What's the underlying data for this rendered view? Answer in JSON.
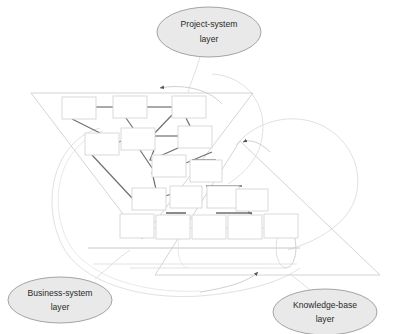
{
  "figure": {
    "kind": "layered-architecture-diagram",
    "background_color": "#ffffff",
    "callout_fill": "#e9e9e9",
    "callout_stroke": "#9a9a9a",
    "callout_text_color": "#2a2a2a",
    "shape_stroke": "#d2d2d2",
    "connector_color": "#6b6b6b",
    "outline_curve_color": "#d8d8d8",
    "arrow_color": "#555555"
  },
  "callouts": [
    {
      "id": "project-system",
      "line1": "Project-system",
      "line2": "layer",
      "cx": 209,
      "cy": 32,
      "rx": 52,
      "ry": 25
    },
    {
      "id": "business-system",
      "line1": "Business-system",
      "line2": "layer",
      "cx": 60,
      "cy": 300,
      "rx": 52,
      "ry": 23
    },
    {
      "id": "knowledge-base",
      "line1": "Knowledge-base",
      "line2": "layer",
      "cx": 325,
      "cy": 312,
      "rx": 52,
      "ry": 23
    }
  ],
  "layers": [
    {
      "id": "project-system-layer",
      "shape": "inverted-triangle",
      "label": "Project-system layer",
      "contents": "network of linked process boxes"
    },
    {
      "id": "business-system-layer",
      "shape": "oval-outline",
      "label": "Business-system layer",
      "contents": "enclosing boundary oval"
    },
    {
      "id": "knowledge-base-layer",
      "shape": "upright-triangle",
      "label": "Knowledge-base layer",
      "contents": "pyramid hierarchy of boxes and a database cylinder"
    }
  ],
  "network_boxes": [
    {
      "id": "n1",
      "x": 62,
      "y": 97,
      "w": 34,
      "h": 22
    },
    {
      "id": "n2",
      "x": 113,
      "y": 96,
      "w": 34,
      "h": 22
    },
    {
      "id": "n3",
      "x": 172,
      "y": 96,
      "w": 34,
      "h": 22
    },
    {
      "id": "n4",
      "x": 85,
      "y": 133,
      "w": 34,
      "h": 22
    },
    {
      "id": "n5",
      "x": 121,
      "y": 128,
      "w": 34,
      "h": 22
    },
    {
      "id": "n6",
      "x": 178,
      "y": 126,
      "w": 34,
      "h": 22
    },
    {
      "id": "n7",
      "x": 152,
      "y": 155,
      "w": 34,
      "h": 22
    },
    {
      "id": "n8",
      "x": 132,
      "y": 188,
      "w": 34,
      "h": 22
    }
  ],
  "network_links": [
    {
      "from": "n1",
      "to": "n2"
    },
    {
      "from": "n2",
      "to": "n3"
    },
    {
      "from": "n1",
      "to": "n4"
    },
    {
      "from": "n2",
      "to": "n5"
    },
    {
      "from": "n3",
      "to": "n5"
    },
    {
      "from": "n4",
      "to": "n5"
    },
    {
      "from": "n5",
      "to": "n6"
    },
    {
      "from": "n3",
      "to": "n6"
    },
    {
      "from": "n5",
      "to": "n7"
    },
    {
      "from": "n6",
      "to": "n7"
    },
    {
      "from": "n4",
      "to": "n8"
    },
    {
      "from": "n7",
      "to": "n8"
    }
  ],
  "pyramid": {
    "levels": [
      {
        "level": 1,
        "count": 1,
        "boxes": [
          {
            "x": 190,
            "y": 160,
            "w": 32,
            "h": 22
          }
        ]
      },
      {
        "level": 2,
        "count": 3,
        "boxes": [
          {
            "x": 170,
            "y": 186,
            "w": 32,
            "h": 22
          },
          {
            "x": 207,
            "y": 186,
            "w": 32,
            "h": 22
          },
          {
            "x": 236,
            "y": 189,
            "w": 32,
            "h": 22
          }
        ]
      },
      {
        "level": 3,
        "count": 5,
        "boxes": [
          {
            "x": 120,
            "y": 214,
            "w": 34,
            "h": 24
          },
          {
            "x": 156,
            "y": 215,
            "w": 34,
            "h": 24
          },
          {
            "x": 192,
            "y": 215,
            "w": 34,
            "h": 24
          },
          {
            "x": 228,
            "y": 215,
            "w": 34,
            "h": 24
          },
          {
            "x": 264,
            "y": 214,
            "w": 34,
            "h": 24
          }
        ]
      }
    ]
  },
  "database_cylinder": {
    "label": "knowledge-base store",
    "x": 118,
    "y": 240,
    "w": 180,
    "h": 22
  },
  "arrows": [
    {
      "id": "arrow-to-project-layer",
      "direction": "left",
      "x": 156,
      "y": 88
    },
    {
      "id": "arrow-to-knowledge-layer",
      "direction": "left",
      "x": 238,
      "y": 143
    },
    {
      "id": "arrow-to-base-line",
      "direction": "down",
      "x": 259,
      "y": 275
    }
  ]
}
